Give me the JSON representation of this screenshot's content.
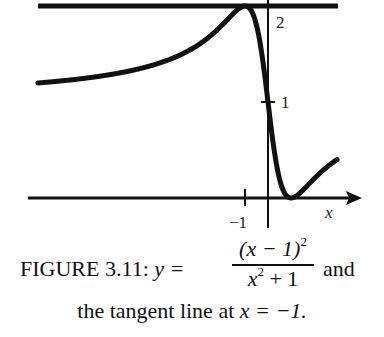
{
  "chart_data": {
    "type": "line",
    "function": "(x-1)^2/(x^2+1)",
    "xlabel": "x",
    "ylabel": "",
    "xlim": [
      -10,
      3
    ],
    "ylim": [
      0,
      2
    ],
    "grid": false,
    "series": [
      {
        "name": "y = (x-1)^2/(x^2+1)",
        "x": [
          -10,
          -8,
          -6,
          -5,
          -4,
          -3,
          -2,
          -1.5,
          -1,
          -0.5,
          0,
          0.5,
          1,
          1.5,
          2,
          2.5,
          3
        ],
        "values": [
          1.198,
          1.246,
          1.324,
          1.385,
          1.471,
          1.6,
          1.8,
          1.923,
          2.0,
          1.8,
          1.0,
          0.2,
          0.0,
          0.077,
          0.2,
          0.31,
          0.4
        ]
      },
      {
        "name": "tangent line at x = -1",
        "x": [
          -10,
          3
        ],
        "values": [
          2,
          2
        ]
      }
    ],
    "x_ticks": [
      {
        "value": -1,
        "label": "−1"
      }
    ],
    "y_ticks": [
      {
        "value": 1,
        "label": "1"
      },
      {
        "value": 2,
        "label": "2"
      }
    ],
    "annotations": [
      "horizontal tangent at (−1, 2)",
      "minimum at (1, 0)"
    ]
  },
  "labels": {
    "x_axis": "x",
    "y_tick_2": "2",
    "y_tick_1": "1",
    "x_tick_neg1": "−1"
  },
  "caption": {
    "prefix": "FIGURE 3.11:",
    "lhs": "y =",
    "numerator": "(x − 1)",
    "numerator_exp": "2",
    "denominator": "x",
    "denominator_exp": "2",
    "denominator_tail": "+ 1",
    "suffix": "and",
    "line2_text": "the tangent line at",
    "line2_math": "x = −1."
  },
  "colors": {
    "ink": "#111111",
    "background": "#ffffff"
  }
}
